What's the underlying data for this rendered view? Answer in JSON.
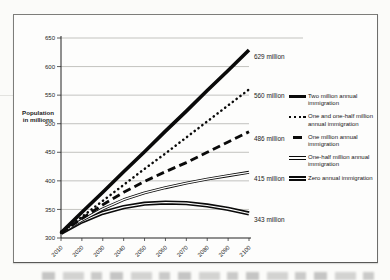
{
  "chart_data": {
    "type": "line",
    "title": "",
    "xlabel": "",
    "ylabel": "Population in millions",
    "x": [
      2010,
      2020,
      2030,
      2040,
      2050,
      2060,
      2070,
      2080,
      2090,
      2100
    ],
    "xlim": [
      2010,
      2100
    ],
    "ylim": [
      300,
      650
    ],
    "yticks": [
      650,
      600,
      550,
      500,
      450,
      400,
      350,
      300
    ],
    "grid": "horizontal-gray",
    "legend_position": "right",
    "line_color": "#0a0a0a",
    "gridline_color": "#b4b4b0",
    "series": [
      {
        "name": "Two million annual immigration",
        "style": "solid-thick",
        "end_label": "629 million",
        "values": [
          309,
          345,
          380,
          416,
          451,
          487,
          522,
          558,
          593,
          629
        ]
      },
      {
        "name": "One and one-half million annual immigration",
        "style": "dotted",
        "end_label": "560 million",
        "values": [
          309,
          337,
          365,
          393,
          421,
          448,
          476,
          504,
          532,
          560
        ]
      },
      {
        "name": "One million annual immigration",
        "style": "dashed",
        "end_label": "486 million",
        "values": [
          309,
          334,
          358,
          380,
          399,
          416,
          432,
          450,
          468,
          486
        ]
      },
      {
        "name": "One-half million annual immigration",
        "style": "double-thin",
        "end_label": "415 million",
        "values": [
          309,
          331,
          351,
          367,
          379,
          388,
          396,
          403,
          409,
          415
        ]
      },
      {
        "name": "Zero annual immigration",
        "style": "double-thick",
        "end_label": "343 million",
        "values": [
          309,
          329,
          344,
          354,
          360,
          362,
          361,
          357,
          351,
          343
        ]
      }
    ]
  }
}
